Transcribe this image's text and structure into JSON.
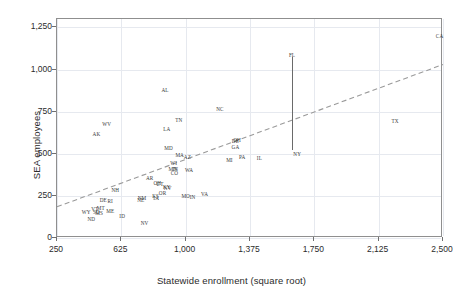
{
  "chart_data": {
    "type": "scatter",
    "title": "",
    "xlabel": "Statewide enrollment (square root)",
    "ylabel": "SEA employees",
    "xlim": [
      250,
      2500
    ],
    "ylim": [
      0,
      1300
    ],
    "xticks": [
      "250",
      "625",
      "1,000",
      "1,375",
      "1,750",
      "2,125",
      "2,500"
    ],
    "xtick_values": [
      250,
      625,
      1000,
      1375,
      1750,
      2125,
      2500
    ],
    "yticks": [
      "0",
      "250",
      "500",
      "750",
      "1,000",
      "1,250"
    ],
    "ytick_values": [
      0,
      250,
      500,
      750,
      1000,
      1250
    ],
    "grid": "both-light",
    "legend": "none",
    "marker_style": "text-label-only",
    "points": [
      {
        "label": "CA",
        "x": 2480,
        "y": 1200
      },
      {
        "label": "FL",
        "x": 1620,
        "y": 1085
      },
      {
        "label": "AL",
        "x": 880,
        "y": 880
      },
      {
        "label": "NC",
        "x": 1200,
        "y": 765
      },
      {
        "label": "TN",
        "x": 960,
        "y": 700
      },
      {
        "label": "TX",
        "x": 2220,
        "y": 695
      },
      {
        "label": "WV",
        "x": 540,
        "y": 675
      },
      {
        "label": "LA",
        "x": 890,
        "y": 645
      },
      {
        "label": "AK",
        "x": 480,
        "y": 620
      },
      {
        "label": "OH",
        "x": 1300,
        "y": 580
      },
      {
        "label": "DE",
        "x": 1290,
        "y": 578
      },
      {
        "label": "GA",
        "x": 1290,
        "y": 540
      },
      {
        "label": "MD",
        "x": 900,
        "y": 535
      },
      {
        "label": "MA",
        "x": 965,
        "y": 490
      },
      {
        "label": "AZ",
        "x": 1010,
        "y": 478
      },
      {
        "label": "PA",
        "x": 1330,
        "y": 478
      },
      {
        "label": "IL",
        "x": 1430,
        "y": 475
      },
      {
        "label": "NY",
        "x": 1650,
        "y": 500
      },
      {
        "label": "MI",
        "x": 1255,
        "y": 462
      },
      {
        "label": "WI",
        "x": 930,
        "y": 445
      },
      {
        "label": "MN",
        "x": 925,
        "y": 412
      },
      {
        "label": "IN",
        "x": 940,
        "y": 410
      },
      {
        "label": "WA",
        "x": 1020,
        "y": 405
      },
      {
        "label": "CO",
        "x": 935,
        "y": 385
      },
      {
        "label": "AR",
        "x": 790,
        "y": 355
      },
      {
        "label": "OH2",
        "x": 835,
        "y": 325
      },
      {
        "label": "UT",
        "x": 850,
        "y": 320
      },
      {
        "label": "KY",
        "x": 890,
        "y": 305
      },
      {
        "label": "NV2",
        "x": 895,
        "y": 298
      },
      {
        "label": "NH",
        "x": 590,
        "y": 287
      },
      {
        "label": "OR",
        "x": 865,
        "y": 268
      },
      {
        "label": "VA",
        "x": 1110,
        "y": 260
      },
      {
        "label": "MO",
        "x": 1000,
        "y": 250
      },
      {
        "label": "IN2",
        "x": 1040,
        "y": 245
      },
      {
        "label": "KS",
        "x": 825,
        "y": 250
      },
      {
        "label": "IA",
        "x": 828,
        "y": 235
      },
      {
        "label": "NM",
        "x": 745,
        "y": 240
      },
      {
        "label": "NE",
        "x": 738,
        "y": 225
      },
      {
        "label": "DE2",
        "x": 520,
        "y": 225
      },
      {
        "label": "RI",
        "x": 560,
        "y": 222
      },
      {
        "label": "MT",
        "x": 505,
        "y": 180
      },
      {
        "label": "VT",
        "x": 470,
        "y": 172
      },
      {
        "label": "ME",
        "x": 560,
        "y": 160
      },
      {
        "label": "WY",
        "x": 420,
        "y": 155
      },
      {
        "label": "SD",
        "x": 480,
        "y": 152
      },
      {
        "label": "MS2",
        "x": 495,
        "y": 150
      },
      {
        "label": "ID",
        "x": 630,
        "y": 130
      },
      {
        "label": "ND",
        "x": 450,
        "y": 110
      },
      {
        "label": "NV",
        "x": 760,
        "y": 90
      }
    ],
    "label_text": {
      "OH2": "OH",
      "NV2": "NV",
      "IN2": "IN",
      "DE2": "DE",
      "MS2": "MS"
    },
    "connector": {
      "description": "vertical line joining FL and NY",
      "from_label": "FL",
      "to_label": "NY",
      "x": 1620,
      "y_top": 1075,
      "y_bottom": 520
    },
    "trendline": {
      "style": "dashed",
      "x_start": 250,
      "y_start": 185,
      "x_end": 2500,
      "y_end": 1030,
      "color": "#9a9a9a"
    },
    "annotations": []
  }
}
